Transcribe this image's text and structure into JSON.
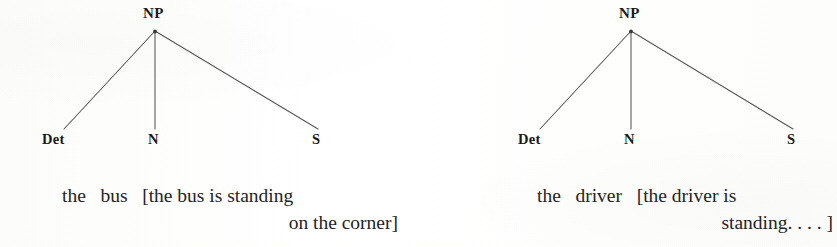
{
  "figure": {
    "kind": "syntax-tree-pair",
    "ink_color": "#2a2a2a",
    "line_color": "#555555",
    "background_color": "#fdfdfc"
  },
  "trees": [
    {
      "id": "tree-left",
      "root": {
        "label": "NP"
      },
      "leaves": [
        {
          "label": "Det"
        },
        {
          "label": "N"
        },
        {
          "label": "S"
        }
      ],
      "gloss_lines": [
        "the   bus   [the bus is standing",
        "on the corner]"
      ],
      "gloss_words": [
        "the",
        "bus",
        "[the bus is standing",
        "on the corner]"
      ]
    },
    {
      "id": "tree-right",
      "root": {
        "label": "NP"
      },
      "leaves": [
        {
          "label": "Det"
        },
        {
          "label": "N"
        },
        {
          "label": "S"
        }
      ],
      "gloss_lines": [
        "the   driver   [the driver is",
        "standing. . . . ]"
      ],
      "gloss_words": [
        "the",
        "driver",
        "[the driver is",
        "standing. . . . ]"
      ]
    }
  ]
}
